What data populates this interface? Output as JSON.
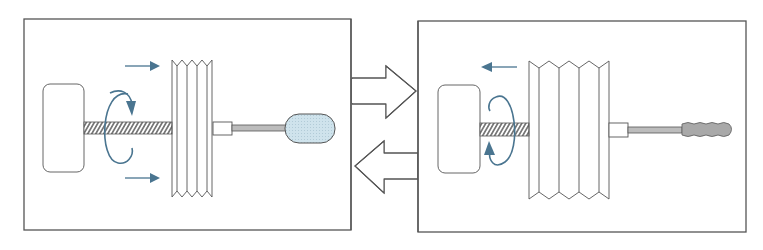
{
  "diagram": {
    "title": "",
    "colors": {
      "line": "#555555",
      "accent": "#4a7590",
      "balloon_fill": "#cfe3ec",
      "rod_fill": "#bcbcbc",
      "deflated_fill": "#a9a9a9",
      "background": "#ffffff"
    },
    "panels": [
      {
        "id": "inflate-state",
        "components": [
          "motor",
          "lead-screw",
          "bellows-compressed",
          "nozzle",
          "rod",
          "balloon-inflated"
        ],
        "motion": {
          "linear_arrows": "right",
          "rotation": "clockwise"
        }
      },
      {
        "id": "deflate-state",
        "components": [
          "motor",
          "lead-screw",
          "bellows-expanded",
          "nozzle",
          "rod",
          "balloon-deflated"
        ],
        "motion": {
          "linear_arrows": "left",
          "rotation": "counter-clockwise"
        }
      }
    ],
    "transition_arrows": [
      {
        "direction": "right",
        "icon": "arrow-right-icon"
      },
      {
        "direction": "left",
        "icon": "arrow-left-icon"
      }
    ]
  }
}
